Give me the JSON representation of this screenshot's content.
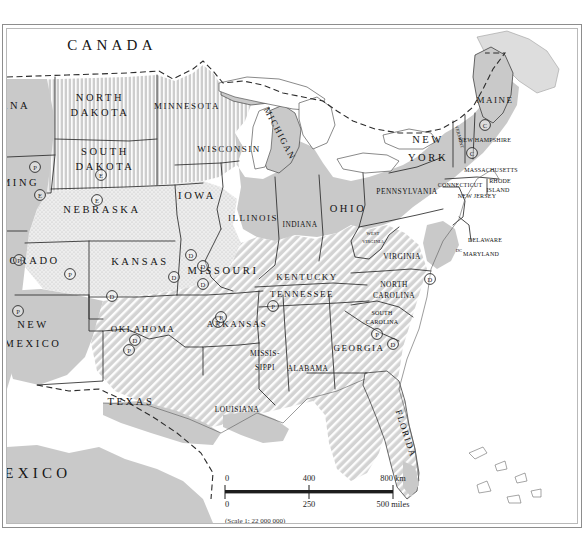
{
  "map": {
    "title_visible": false,
    "projection_note": "(Scale 1: 22 000 000)",
    "colors": {
      "land_fill": "#c9c9c9",
      "land_light": "#e2e2e2",
      "water": "#ffffff",
      "outline": "#2b2b2b",
      "border_dash": "#2b2b2b",
      "text": "#141414",
      "frame_outer": "#8d8d8d",
      "frame_inner": "#b9b9b9"
    },
    "countries": [
      {
        "name": "CANADA",
        "x": 105,
        "y": 18,
        "class": "country"
      },
      {
        "name": "MEXICO",
        "x": 22,
        "y": 446,
        "class": "country"
      }
    ],
    "states": [
      {
        "name": "ANA",
        "x": 8,
        "y": 78,
        "class": "st-lg"
      },
      {
        "name": "OMING",
        "x": 8,
        "y": 155,
        "class": "st-lg"
      },
      {
        "name": "NORTH",
        "x": 93,
        "y": 70,
        "class": "st-lg"
      },
      {
        "name": "DAKOTA",
        "x": 93,
        "y": 85,
        "class": "st-lg"
      },
      {
        "name": "SOUTH",
        "x": 98,
        "y": 124,
        "class": "st-lg"
      },
      {
        "name": "DAKOTA",
        "x": 98,
        "y": 139,
        "class": "st-lg"
      },
      {
        "name": "MINNESOTA",
        "x": 180,
        "y": 78,
        "class": "st-md"
      },
      {
        "name": "WISCONSIN",
        "x": 222,
        "y": 121,
        "class": "st-md"
      },
      {
        "name": "IOWA",
        "x": 190,
        "y": 168,
        "class": "st-lg"
      },
      {
        "name": "NEBRASKA",
        "x": 95,
        "y": 182,
        "class": "st-lg"
      },
      {
        "name": "OLORADO",
        "x": 18,
        "y": 233,
        "class": "st-lg"
      },
      {
        "name": "KANSAS",
        "x": 133,
        "y": 234,
        "class": "st-lg"
      },
      {
        "name": "MISSOURI",
        "x": 216,
        "y": 243,
        "class": "st-lg"
      },
      {
        "name": "ILLINOIS",
        "x": 246,
        "y": 190,
        "class": "st-md"
      },
      {
        "name": "INDIANA",
        "x": 293,
        "y": 196,
        "class": "st-sm"
      },
      {
        "name": "OHIO",
        "x": 341,
        "y": 181,
        "class": "st-lg"
      },
      {
        "name": "KENTUCKY",
        "x": 300,
        "y": 249,
        "class": "st-md"
      },
      {
        "name": "TENNESSEE",
        "x": 295,
        "y": 266,
        "class": "st-md"
      },
      {
        "name": "ARKANSAS",
        "x": 230,
        "y": 296,
        "class": "st-md"
      },
      {
        "name": "OKLAHOMA",
        "x": 136,
        "y": 301,
        "class": "st-md"
      },
      {
        "name": "NEW",
        "x": 26,
        "y": 297,
        "class": "st-lg"
      },
      {
        "name": "MEXICO",
        "x": 26,
        "y": 316,
        "class": "st-lg"
      },
      {
        "name": "TEXAS",
        "x": 124,
        "y": 374,
        "class": "st-lg"
      },
      {
        "name": "LOUISIANA",
        "x": 230,
        "y": 381,
        "class": "st-sm"
      },
      {
        "name": "MISSIS-",
        "x": 258,
        "y": 325,
        "class": "st-sm"
      },
      {
        "name": "SIPPI",
        "x": 258,
        "y": 339,
        "class": "st-sm"
      },
      {
        "name": "ALABAMA",
        "x": 301,
        "y": 340,
        "class": "st-sm"
      },
      {
        "name": "GEORGIA",
        "x": 352,
        "y": 320,
        "class": "st-md"
      },
      {
        "name": "SOUTH",
        "x": 375,
        "y": 285,
        "class": "st-xs"
      },
      {
        "name": "CAROLINA",
        "x": 375,
        "y": 294,
        "class": "st-xs"
      },
      {
        "name": "NORTH",
        "x": 387,
        "y": 256,
        "class": "st-sm"
      },
      {
        "name": "CAROLINA",
        "x": 387,
        "y": 267,
        "class": "st-sm"
      },
      {
        "name": "VIRGINIA",
        "x": 395,
        "y": 228,
        "class": "st-sm"
      },
      {
        "name": "WEST",
        "x": 366,
        "y": 205,
        "class": "st-tiny"
      },
      {
        "name": "VIRGINIA",
        "x": 366,
        "y": 213,
        "class": "st-tiny"
      },
      {
        "name": "PENNSYLVANIA",
        "x": 400,
        "y": 163,
        "class": "st-sm"
      },
      {
        "name": "NEW",
        "x": 421,
        "y": 112,
        "class": "st-lg"
      },
      {
        "name": "YORK",
        "x": 421,
        "y": 130,
        "class": "st-lg"
      },
      {
        "name": "MAINE",
        "x": 488,
        "y": 72,
        "class": "st-md"
      },
      {
        "name": "NEW HAMPSHIRE",
        "x": 478,
        "y": 112,
        "class": "st-xs"
      },
      {
        "name": "MASSACHUSETTS",
        "x": 484,
        "y": 142,
        "class": "st-xs"
      },
      {
        "name": "CONNECTICUT",
        "x": 453,
        "y": 157,
        "class": "st-xs"
      },
      {
        "name": "RHODE",
        "x": 493,
        "y": 153,
        "class": "st-xs"
      },
      {
        "name": "ISLAND",
        "x": 491,
        "y": 162,
        "class": "st-xs"
      },
      {
        "name": "NEW JERSEY",
        "x": 470,
        "y": 168,
        "class": "st-xs"
      },
      {
        "name": "DELAWARE",
        "x": 478,
        "y": 212,
        "class": "st-xs"
      },
      {
        "name": "MARYLAND",
        "x": 474,
        "y": 226,
        "class": "st-xs"
      },
      {
        "name": "DC",
        "x": 452,
        "y": 222,
        "class": "st-tiny"
      }
    ],
    "rotated_states": [
      {
        "name": "MICHIGAN",
        "x": 272,
        "y": 105,
        "rotate": 62,
        "class": "st-md"
      },
      {
        "name": "VERMONT",
        "x": 452,
        "y": 108,
        "rotate": 75,
        "class": "st-tiny"
      },
      {
        "name": "FLORIDA",
        "x": 398,
        "y": 405,
        "rotate": 72,
        "class": "st-md"
      }
    ],
    "markers": [
      {
        "label": "P",
        "x": 28,
        "y": 138
      },
      {
        "label": "E",
        "x": 33,
        "y": 166
      },
      {
        "label": "E",
        "x": 94,
        "y": 146
      },
      {
        "label": "E",
        "x": 90,
        "y": 171
      },
      {
        "label": "P",
        "x": 12,
        "y": 231
      },
      {
        "label": "P",
        "x": 63,
        "y": 245
      },
      {
        "label": "P",
        "x": 11,
        "y": 282
      },
      {
        "label": "D",
        "x": 105,
        "y": 267
      },
      {
        "label": "D",
        "x": 184,
        "y": 226
      },
      {
        "label": "D",
        "x": 196,
        "y": 237
      },
      {
        "label": "D",
        "x": 196,
        "y": 255
      },
      {
        "label": "D",
        "x": 167,
        "y": 248
      },
      {
        "label": "P",
        "x": 211,
        "y": 293
      },
      {
        "label": "D",
        "x": 128,
        "y": 311
      },
      {
        "label": "P",
        "x": 122,
        "y": 321
      },
      {
        "label": "P",
        "x": 214,
        "y": 288
      },
      {
        "label": "P",
        "x": 266,
        "y": 277
      },
      {
        "label": "C",
        "x": 478,
        "y": 96
      },
      {
        "label": "C",
        "x": 465,
        "y": 124
      },
      {
        "label": "D",
        "x": 423,
        "y": 250
      },
      {
        "label": "P",
        "x": 370,
        "y": 305
      },
      {
        "label": "D",
        "x": 386,
        "y": 315
      }
    ],
    "scale_bar": {
      "km_ticks": [
        "0",
        "400",
        "800 km"
      ],
      "mile_ticks": [
        "0",
        "250",
        "500 miles"
      ],
      "note": "(Scale 1: 22 000 000)",
      "x": 218,
      "y": 460,
      "width": 170
    }
  }
}
